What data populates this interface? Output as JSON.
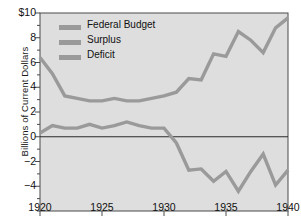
{
  "chart_data": {
    "type": "line",
    "title": "",
    "xlabel": "",
    "ylabel": "Billions of Current Dollars",
    "xlim": [
      1920,
      1940
    ],
    "ylim": [
      -6,
      10
    ],
    "grid": false,
    "legend_position": "upper left inside axes",
    "x": [
      1920,
      1921,
      1922,
      1923,
      1924,
      1925,
      1926,
      1927,
      1928,
      1929,
      1930,
      1931,
      1932,
      1933,
      1934,
      1935,
      1936,
      1937,
      1938,
      1939,
      1940
    ],
    "xticks": [
      1920,
      1925,
      1930,
      1935,
      1940
    ],
    "xtick_labels": [
      "1920",
      "1925",
      "1930",
      "1935",
      "1940"
    ],
    "yticks": [
      10,
      8,
      6,
      4,
      2,
      0,
      -2,
      -4
    ],
    "ytick_labels": [
      "$10",
      "8",
      "6",
      "4",
      "2",
      "0",
      "−2",
      "−4"
    ],
    "yminor_step": 1,
    "zero_line": 0,
    "series": [
      {
        "name": "Federal Budget",
        "color": "#9a9a9a",
        "values": [
          6.4,
          5.1,
          3.3,
          3.1,
          2.9,
          2.9,
          3.1,
          2.9,
          2.9,
          3.1,
          3.3,
          3.6,
          4.7,
          4.6,
          6.7,
          6.5,
          8.5,
          7.8,
          6.8,
          8.8,
          9.6
        ]
      },
      {
        "name": "Surplus",
        "color": "#9a9a9a",
        "values": [
          0.3,
          0.9,
          0.7,
          0.7,
          1.0,
          0.7,
          0.9,
          1.2,
          0.9,
          0.7,
          0.7,
          -0.5,
          -2.7,
          -2.6,
          -3.6,
          -2.8,
          -4.4,
          -2.8,
          -1.4,
          -3.9,
          -2.7
        ]
      }
    ],
    "surplus_segment_years": [
      1920,
      1921,
      1922,
      1923,
      1924,
      1925,
      1926,
      1927,
      1928,
      1929,
      1930
    ],
    "deficit_segment_years": [
      1931,
      1932,
      1933,
      1934,
      1935,
      1936,
      1937,
      1938,
      1939,
      1940
    ],
    "legend": [
      {
        "label": "Federal Budget",
        "color": "#9a9a9a"
      },
      {
        "label": "Surplus",
        "color": "#9a9a9a"
      },
      {
        "label": "Deficit",
        "color": "#9a9a9a"
      }
    ],
    "colors": {
      "plot_background": "#dedede",
      "line": "#9a9a9a",
      "axis": "#4a4a4a",
      "zero_line": "#2a2a2a",
      "text": "#111111"
    }
  }
}
